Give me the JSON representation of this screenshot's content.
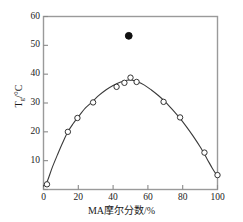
{
  "chart_data": {
    "type": "scatter",
    "title": "",
    "xlabel": "MA摩尔分数/%",
    "ylabel": "Tg/°C",
    "ylabel_base": "T",
    "ylabel_sub": "g",
    "ylabel_unit": "/°C",
    "xlim": [
      0,
      100
    ],
    "ylim": [
      0,
      60
    ],
    "xticks": [
      0,
      20,
      40,
      60,
      80,
      100
    ],
    "yticks": [
      0,
      10,
      20,
      30,
      40,
      50,
      60
    ],
    "xtick_labels": [
      "0",
      "20",
      "40",
      "60",
      "80",
      "100"
    ],
    "ytick_labels": [
      "10",
      "20",
      "30",
      "40",
      "50",
      "60"
    ],
    "grid": false,
    "legend": "none",
    "frame": "box",
    "series": [
      {
        "name": "open-circles",
        "marker": "open-circle",
        "marker_color": "#ffffff",
        "edge_color": "#333333",
        "x": [
          2,
          14,
          19.5,
          28.5,
          42,
          46.5,
          50,
          53.5,
          69,
          78.5,
          92.5,
          100
        ],
        "y": [
          1.8,
          20.0,
          24.8,
          30.2,
          35.6,
          37.0,
          38.8,
          37.3,
          30.4,
          25.0,
          12.8,
          5.0
        ]
      },
      {
        "name": "filled-point",
        "marker": "filled-circle",
        "marker_color": "#101010",
        "edge_color": "#101010",
        "x": [
          49
        ],
        "y": [
          53.3
        ]
      }
    ],
    "fit_curve": {
      "name": "fitted-curve",
      "color": "#3a3a3a",
      "x": [
        0,
        2,
        5,
        8,
        11,
        14,
        17,
        20,
        24,
        28,
        32,
        36,
        40,
        44,
        48,
        51,
        54,
        58,
        62,
        66,
        70,
        74,
        78,
        82,
        86,
        90,
        94,
        97,
        100
      ],
      "y": [
        1.2,
        2.6,
        7.6,
        12.0,
        16.2,
        20.0,
        22.8,
        25.2,
        28.2,
        30.4,
        32.7,
        34.6,
        36.1,
        37.2,
        37.9,
        37.9,
        37.4,
        36.2,
        34.5,
        32.6,
        30.4,
        27.8,
        25.0,
        21.9,
        18.5,
        14.8,
        10.6,
        7.4,
        4.6
      ]
    }
  }
}
